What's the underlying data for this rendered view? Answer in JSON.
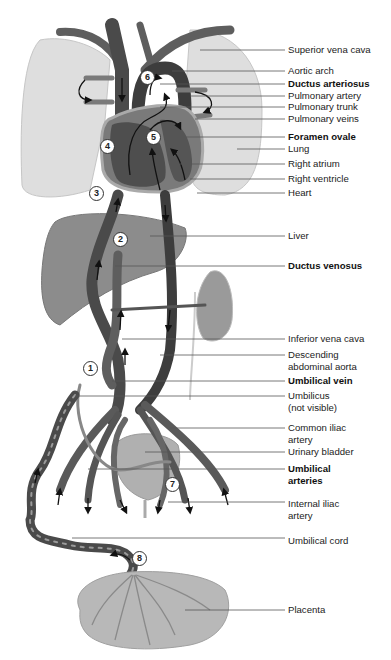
{
  "figure": {
    "type": "anatomical-diagram",
    "colors": {
      "vessel": "#5a5a5a",
      "vessel_dark": "#3a3a3a",
      "organ_fill": "#8a8a8a",
      "lung_fill": "#dcdcdc",
      "placenta_fill": "#b4b4b4",
      "leader_line": "#555555",
      "text": "#222222"
    }
  },
  "labels": [
    {
      "id": "superior-vena-cava",
      "text": "Superior vena cava",
      "bold": false,
      "y": 44,
      "lead_y": 50,
      "from_x": 200
    },
    {
      "id": "aortic-arch",
      "text": "Aortic arch",
      "bold": false,
      "y": 65,
      "lead_y": 71,
      "from_x": 172
    },
    {
      "id": "ductus-arteriosus",
      "text": "Ductus arteriosus",
      "bold": true,
      "y": 78,
      "lead_y": 84,
      "from_x": 160
    },
    {
      "id": "pulmonary-artery",
      "text": "Pulmonary artery",
      "bold": false,
      "y": 90,
      "lead_y": 96,
      "from_x": 190
    },
    {
      "id": "pulmonary-trunk",
      "text": "Pulmonary trunk",
      "bold": false,
      "y": 101,
      "lead_y": 107,
      "from_x": 160
    },
    {
      "id": "pulmonary-veins",
      "text": "Pulmonary veins",
      "bold": false,
      "y": 113,
      "lead_y": 119,
      "from_x": 195
    },
    {
      "id": "foramen-ovale",
      "text": "Foramen ovale",
      "bold": true,
      "y": 131,
      "lead_y": 137,
      "from_x": 180
    },
    {
      "id": "lung",
      "text": "Lung",
      "bold": false,
      "y": 143,
      "lead_y": 149,
      "from_x": 237
    },
    {
      "id": "right-atrium",
      "text": "Right atrium",
      "bold": false,
      "y": 158,
      "lead_y": 164,
      "from_x": 180
    },
    {
      "id": "right-ventricle",
      "text": "Right ventricle",
      "bold": false,
      "y": 173,
      "lead_y": 179,
      "from_x": 190
    },
    {
      "id": "heart",
      "text": "Heart",
      "bold": false,
      "y": 187,
      "lead_y": 193,
      "from_x": 197
    },
    {
      "id": "liver",
      "text": "Liver",
      "bold": false,
      "y": 230,
      "lead_y": 236,
      "from_x": 150
    },
    {
      "id": "ductus-venosus",
      "text": "Ductus venosus",
      "bold": true,
      "y": 260,
      "lead_y": 266,
      "from_x": 115
    },
    {
      "id": "inferior-vena-cava",
      "text": "Inferior vena cava",
      "bold": false,
      "y": 333,
      "lead_y": 339,
      "from_x": 122
    },
    {
      "id": "descending-abdominal-aorta",
      "text": "Descending",
      "text2": "abdominal aorta",
      "bold": false,
      "y": 349,
      "lead_y": 355,
      "from_x": 160
    },
    {
      "id": "umbilical-vein",
      "text": "Umbilical vein",
      "bold": true,
      "y": 375,
      "lead_y": 381,
      "from_x": 112
    },
    {
      "id": "umbilicus",
      "text": "Umbilicus",
      "text2": "(not visible)",
      "bold": false,
      "y": 390,
      "lead_y": 396,
      "from_x": 75
    },
    {
      "id": "common-iliac-artery",
      "text": "Common iliac",
      "text2": "artery",
      "bold": false,
      "y": 422,
      "lead_y": 428,
      "from_x": 170
    },
    {
      "id": "urinary-bladder",
      "text": "Urinary bladder",
      "bold": false,
      "y": 446,
      "lead_y": 452,
      "from_x": 145
    },
    {
      "id": "umbilical-arteries",
      "text": "Umbilical",
      "text2": "arteries",
      "bold": true,
      "y": 463,
      "lead_y": 469,
      "from_x": 88
    },
    {
      "id": "internal-iliac-artery",
      "text": "Internal iliac",
      "text2": "artery",
      "bold": false,
      "y": 498,
      "lead_y": 502,
      "from_x": 168
    },
    {
      "id": "umbilical-cord",
      "text": "Umbilical cord",
      "bold": false,
      "y": 535,
      "lead_y": 538,
      "from_x": 72
    },
    {
      "id": "placenta",
      "text": "Placenta",
      "bold": false,
      "y": 604,
      "lead_y": 610,
      "from_x": 185
    }
  ],
  "step_markers": [
    {
      "n": "1",
      "x": 90,
      "y": 368
    },
    {
      "n": "2",
      "x": 120,
      "y": 239
    },
    {
      "n": "3",
      "x": 96,
      "y": 193
    },
    {
      "n": "4",
      "x": 107,
      "y": 146
    },
    {
      "n": "5",
      "x": 153,
      "y": 137
    },
    {
      "n": "6",
      "x": 147,
      "y": 77
    },
    {
      "n": "7",
      "x": 172,
      "y": 484
    },
    {
      "n": "8",
      "x": 139,
      "y": 558
    }
  ]
}
